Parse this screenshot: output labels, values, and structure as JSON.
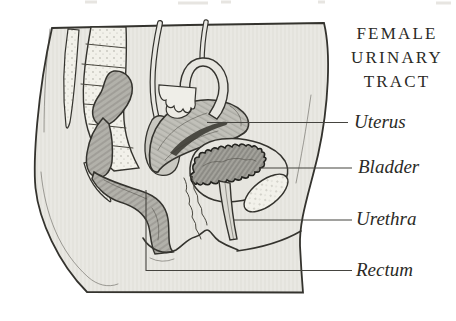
{
  "title": {
    "lines": [
      "FEMALE",
      "URINARY",
      "TRACT"
    ]
  },
  "labels": [
    {
      "text": "Uterus"
    },
    {
      "text": "Bladder"
    },
    {
      "text": "Urethra"
    },
    {
      "text": "Rectum"
    }
  ],
  "figure": {
    "kind": "anatomical line illustration, sagittal cross-section of female pelvis",
    "labeled_structures": [
      "Uterus",
      "Bladder",
      "Urethra",
      "Rectum"
    ],
    "unlabeled_structures": [
      "spine",
      "sacrum",
      "coccyx",
      "sigmoid colon",
      "fallopian tube",
      "ovary",
      "vagina",
      "pubic bone"
    ]
  },
  "colors": {
    "background": "#ffffff",
    "body_fill": "#e9e8e3",
    "organ_dark_fill": "#b2b1aa",
    "uterus_fill": "#c1c0b9",
    "bladder_fill": "#e6e5df",
    "bladder_lumen_fill": "#a3a29b",
    "bone_fill": "#f2f1ea",
    "outline": "#34332e",
    "leader_line": "#45443f",
    "text": "#2b2a26"
  }
}
